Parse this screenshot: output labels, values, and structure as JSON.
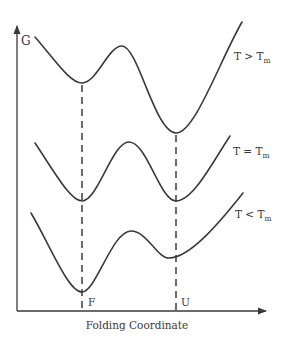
{
  "diagram": {
    "y_axis_label": "G",
    "x_axis_label": "Folding Coordinate",
    "markers": [
      {
        "label": "F",
        "x": 82
      },
      {
        "label": "U",
        "x": 176
      }
    ],
    "curves": [
      {
        "label_main": "T > T",
        "label_sub": "m",
        "condition": "T > Tm"
      },
      {
        "label_main": "T = T",
        "label_sub": "m",
        "condition": "T = Tm"
      },
      {
        "label_main": "T < T",
        "label_sub": "m",
        "condition": "T < Tm"
      }
    ],
    "colors": {
      "ink": "#3a3a3a",
      "background": "#ffffff"
    }
  }
}
